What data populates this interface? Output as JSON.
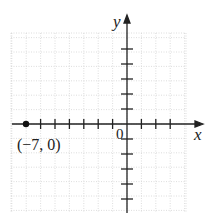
{
  "diagram": {
    "type": "coordinate-plane",
    "axes": {
      "x_label": "x",
      "y_label": "y",
      "origin_label": "0",
      "x_range": [
        -8,
        4
      ],
      "y_range": [
        -6,
        6
      ]
    },
    "grid": {
      "style": "dotted",
      "color": "#cfcfcf"
    },
    "axis_color": "#222222",
    "points": [
      {
        "x": -7,
        "y": 0,
        "label": "(−7, 0)"
      }
    ]
  },
  "chart_data": {
    "type": "scatter",
    "title": "",
    "xlabel": "x",
    "ylabel": "y",
    "x": [
      -7
    ],
    "y": [
      0
    ],
    "annotations": [
      "(−7, 0)"
    ],
    "grid": true,
    "xlim": [
      -8,
      4
    ],
    "ylim": [
      -6,
      6
    ]
  }
}
